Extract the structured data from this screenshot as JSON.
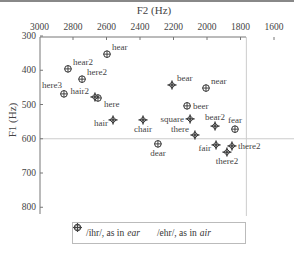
{
  "chart_data": {
    "type": "scatter",
    "title": "",
    "xlabel": "F2 (Hz)",
    "ylabel": "F1 (Hz)",
    "x_axis_position": "top",
    "x_reversed": true,
    "y_reversed": true,
    "xlim": [
      3000,
      1550
    ],
    "ylim": [
      300,
      820
    ],
    "x_ticks": [
      3000,
      2800,
      2600,
      2400,
      2200,
      2000,
      1800,
      1600
    ],
    "y_ticks": [
      300,
      400,
      500,
      600,
      700,
      800
    ],
    "reference_lines": {
      "vertical_F2": 1765,
      "horizontal_F1": 600
    },
    "legend_position": "bottom",
    "series": [
      {
        "name": "/ihr/, as in ear",
        "marker": "circle-plus",
        "points": [
          {
            "label": "hear",
            "F2": 2597,
            "F1": 353,
            "label_pos": "right-up"
          },
          {
            "label": "hear2",
            "F2": 2830,
            "F1": 396,
            "label_pos": "right-up"
          },
          {
            "label": "here2",
            "F2": 2746,
            "F1": 426,
            "label_pos": "right-up"
          },
          {
            "label": "here3",
            "F2": 2854,
            "F1": 469,
            "label_pos": "above-left"
          },
          {
            "label": "here",
            "F2": 2651,
            "F1": 481,
            "label_pos": "below-right"
          },
          {
            "label": "near",
            "F2": 2006,
            "F1": 452,
            "label_pos": "right-up"
          },
          {
            "label": "beer",
            "F2": 2119,
            "F1": 504,
            "label_pos": "right"
          },
          {
            "label": "fear",
            "F2": 1833,
            "F1": 572,
            "label_pos": "above"
          },
          {
            "label": "dear",
            "F2": 2293,
            "F1": 615,
            "label_pos": "below"
          }
        ]
      },
      {
        "name": "/ehr/, as in air",
        "marker": "diamond-plus",
        "points": [
          {
            "label": "hair2",
            "F2": 2669,
            "F1": 478,
            "label_pos": "left-up"
          },
          {
            "label": "hair",
            "F2": 2561,
            "F1": 545,
            "label_pos": "left-down"
          },
          {
            "label": "chair",
            "F2": 2382,
            "F1": 545,
            "label_pos": "below"
          },
          {
            "label": "bear",
            "F2": 2209,
            "F1": 443,
            "label_pos": "right-up"
          },
          {
            "label": "square",
            "F2": 2101,
            "F1": 542,
            "label_pos": "left"
          },
          {
            "label": "bear2",
            "F2": 1952,
            "F1": 563,
            "label_pos": "above"
          },
          {
            "label": "there",
            "F2": 2072,
            "F1": 589,
            "label_pos": "left-up"
          },
          {
            "label": "fair",
            "F2": 1946,
            "F1": 618,
            "label_pos": "left-down"
          },
          {
            "label": "there2",
            "F2": 1851,
            "F1": 621,
            "label_pos": "right"
          },
          {
            "label": "there2",
            "F2": 1881,
            "F1": 639,
            "label_pos": "below"
          }
        ]
      }
    ]
  },
  "legend": {
    "ihr_text": "/ihr/, as in",
    "ihr_word": "ear",
    "ehr_text": "/ehr/, as in",
    "ehr_word": "air"
  }
}
